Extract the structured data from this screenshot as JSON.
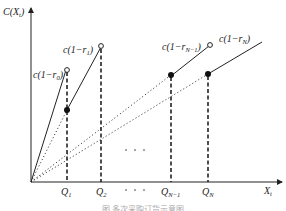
{
  "figure": {
    "y_axis_label": "C(X",
    "y_axis_label_sub": "t",
    "x_axis_label": "X",
    "x_axis_label_sub": "t",
    "ellipsis_mid": "· · ·",
    "ellipsis_axis": "· · ·",
    "caption": "图  多次采购订货示意图",
    "colors": {
      "line": "#222222",
      "background": "#ffffff"
    }
  },
  "points": [
    {
      "id": "Q1",
      "label": "Q",
      "label_sub": "1",
      "price_label": "c(1−r",
      "price_sub": "0",
      "price_tail": ")"
    },
    {
      "id": "Q2",
      "label": "Q",
      "label_sub": "2",
      "price_label": "c(1−r",
      "price_sub": "1",
      "price_tail": ")"
    },
    {
      "id": "QN-1",
      "label": "Q",
      "label_sub": "N−1",
      "price_label": "c(1−r",
      "price_sub": "N−1",
      "price_tail": ")"
    },
    {
      "id": "QN",
      "label": "Q",
      "label_sub": "N",
      "price_label": "c(1−r",
      "price_sub": "N",
      "price_tail": ")"
    }
  ]
}
